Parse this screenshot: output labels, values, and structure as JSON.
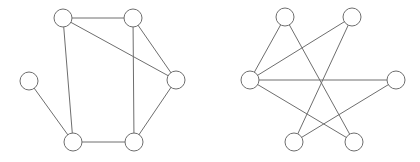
{
  "graphs": [
    {
      "name": "left-graph",
      "nodes": [
        {
          "id": "A",
          "x": 63,
          "y": 18
        },
        {
          "id": "B",
          "x": 133,
          "y": 18
        },
        {
          "id": "C",
          "x": 29,
          "y": 81
        },
        {
          "id": "D",
          "x": 176,
          "y": 80
        },
        {
          "id": "E",
          "x": 73,
          "y": 142
        },
        {
          "id": "F",
          "x": 134,
          "y": 142
        }
      ],
      "edges": [
        [
          "A",
          "B"
        ],
        [
          "A",
          "D"
        ],
        [
          "A",
          "E"
        ],
        [
          "B",
          "D"
        ],
        [
          "B",
          "F"
        ],
        [
          "C",
          "E"
        ],
        [
          "D",
          "F"
        ],
        [
          "E",
          "F"
        ]
      ]
    },
    {
      "name": "right-graph",
      "nodes": [
        {
          "id": "P",
          "x": 285,
          "y": 17
        },
        {
          "id": "Q",
          "x": 352,
          "y": 17
        },
        {
          "id": "R",
          "x": 250,
          "y": 80
        },
        {
          "id": "S",
          "x": 396,
          "y": 80
        },
        {
          "id": "T",
          "x": 294,
          "y": 142
        },
        {
          "id": "U",
          "x": 354,
          "y": 142
        }
      ],
      "edges": [
        [
          "P",
          "R"
        ],
        [
          "P",
          "U"
        ],
        [
          "Q",
          "R"
        ],
        [
          "Q",
          "T"
        ],
        [
          "R",
          "S"
        ],
        [
          "R",
          "U"
        ],
        [
          "S",
          "T"
        ]
      ]
    }
  ],
  "style": {
    "node_radius": 9,
    "stroke_color": "#6e6e6e",
    "node_fill": "#ffffff",
    "background": "#ffffff"
  }
}
